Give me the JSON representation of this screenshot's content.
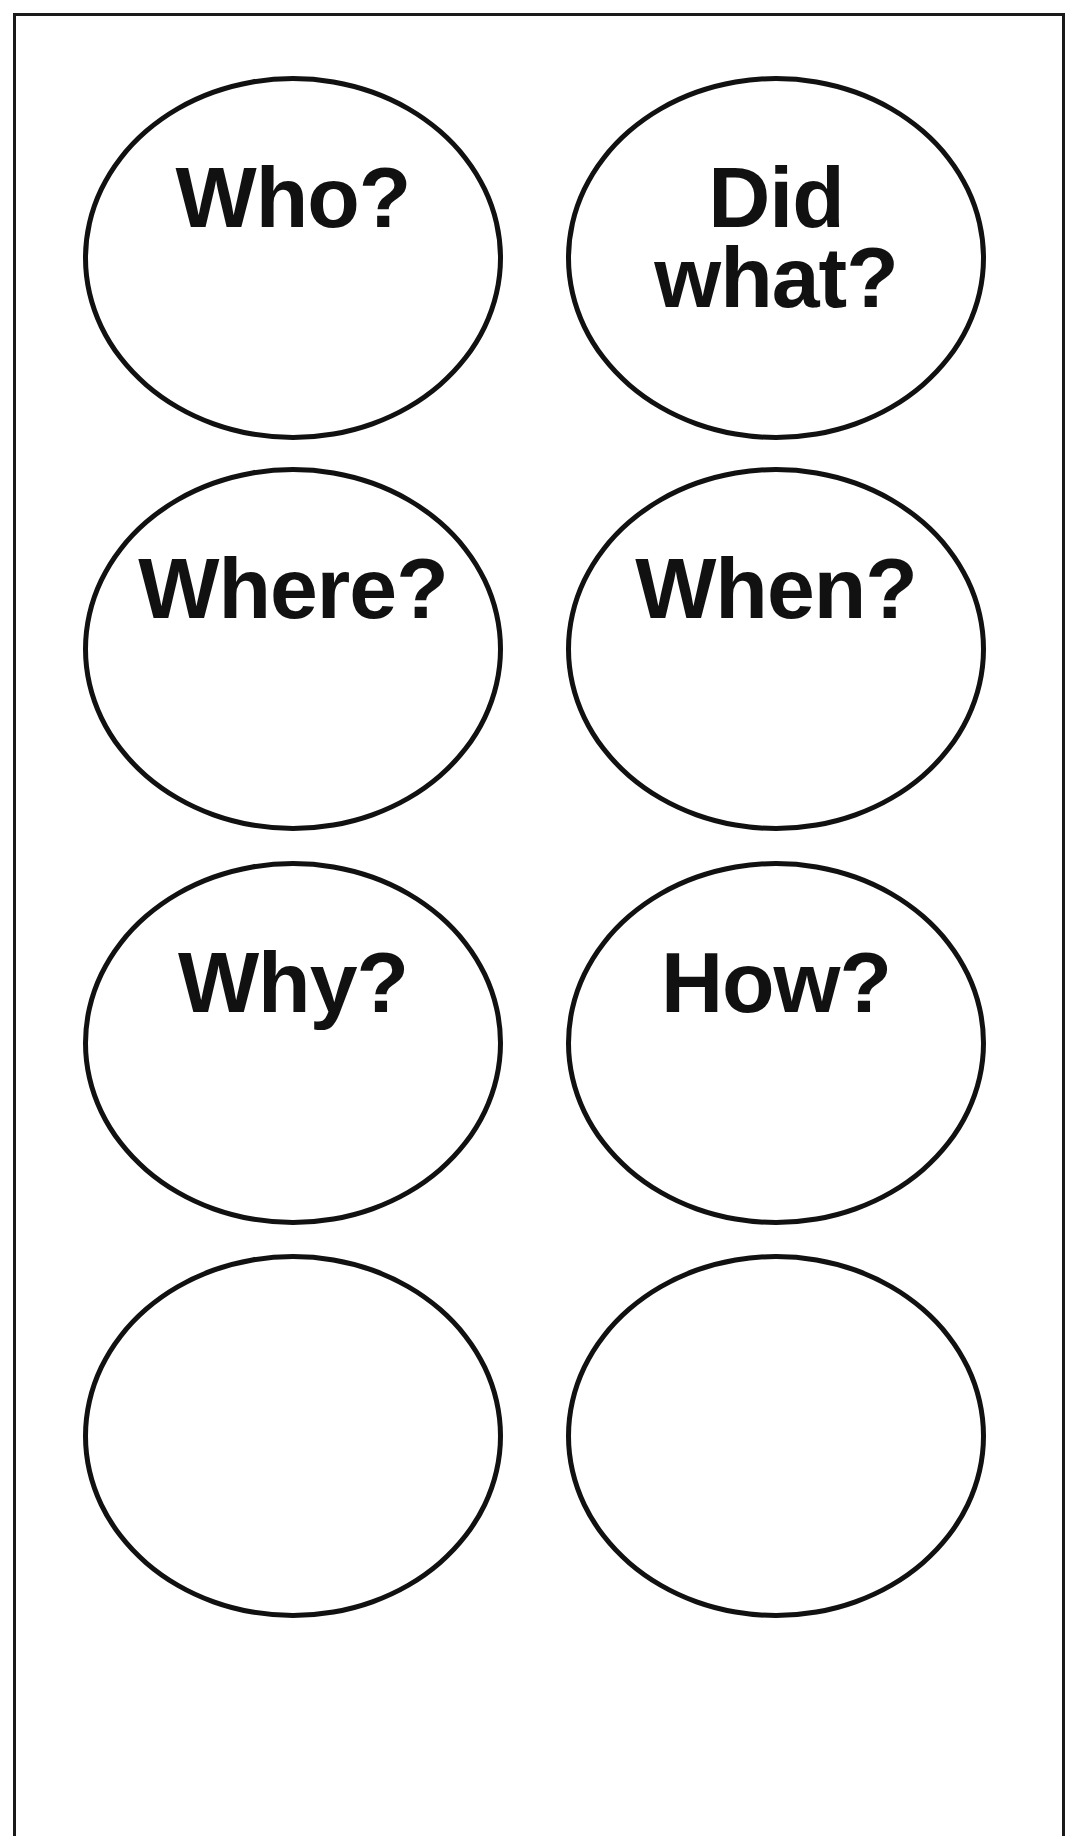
{
  "worksheet": {
    "frame_color": "#1a1a1a",
    "bubble_stroke_color": "#111111",
    "bubbles": [
      {
        "position": "row-1-left",
        "lines": [
          "Who?"
        ]
      },
      {
        "position": "row-1-right",
        "lines": [
          "Did",
          "what?"
        ]
      },
      {
        "position": "row-2-left",
        "lines": [
          "Where?"
        ]
      },
      {
        "position": "row-2-right",
        "lines": [
          "When?"
        ]
      },
      {
        "position": "row-3-left",
        "lines": [
          "Why?"
        ]
      },
      {
        "position": "row-3-right",
        "lines": [
          "How?"
        ]
      },
      {
        "position": "row-4-left",
        "lines": []
      },
      {
        "position": "row-4-right",
        "lines": []
      }
    ]
  }
}
